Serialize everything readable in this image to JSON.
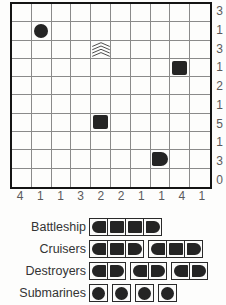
{
  "puzzle": {
    "rows": 10,
    "cols": 10,
    "row_clues": [
      3,
      1,
      3,
      1,
      2,
      1,
      5,
      1,
      3,
      0
    ],
    "col_clues": [
      4,
      1,
      1,
      3,
      2,
      2,
      1,
      1,
      4,
      1
    ],
    "givens": [
      {
        "row": 2,
        "col": 2,
        "type": "submarine"
      },
      {
        "row": 3,
        "col": 5,
        "type": "water"
      },
      {
        "row": 4,
        "col": 9,
        "type": "ship-middle"
      },
      {
        "row": 7,
        "col": 5,
        "type": "ship-middle"
      },
      {
        "row": 9,
        "col": 8,
        "type": "ship-end-right"
      }
    ]
  },
  "legend": {
    "rows": [
      {
        "label": "Battleship",
        "ships": [
          [
            "end-left",
            "mid",
            "mid",
            "end-right"
          ]
        ]
      },
      {
        "label": "Cruisers",
        "ships": [
          [
            "end-left",
            "mid",
            "end-right"
          ],
          [
            "end-left",
            "mid",
            "end-right"
          ]
        ]
      },
      {
        "label": "Destroyers",
        "ships": [
          [
            "end-left",
            "end-right"
          ],
          [
            "end-left",
            "end-right"
          ],
          [
            "end-left",
            "end-right"
          ]
        ]
      },
      {
        "label": "Submarines",
        "ships": [
          [
            "sub"
          ],
          [
            "sub"
          ],
          [
            "sub"
          ],
          [
            "sub"
          ]
        ]
      }
    ]
  },
  "colors": {
    "ship": "#242424",
    "grid_line": "#8a8a8a",
    "grid_border": "#141414",
    "clue_text": "#59595b",
    "label_text": "#343434"
  }
}
